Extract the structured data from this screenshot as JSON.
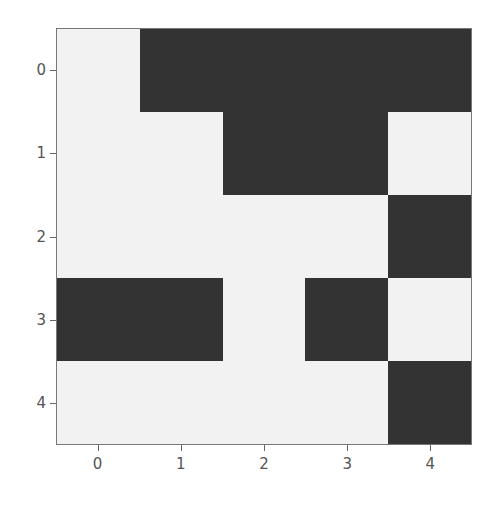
{
  "chart_data": {
    "type": "heatmap",
    "title": "",
    "xlabel": "",
    "ylabel": "",
    "x_ticks": [
      "0",
      "1",
      "2",
      "3",
      "4"
    ],
    "y_ticks": [
      "0",
      "1",
      "2",
      "3",
      "4"
    ],
    "colormap": {
      "0": "#f2f2f2",
      "1": "#333333"
    },
    "grid": false,
    "matrix": [
      [
        0,
        1,
        1,
        1,
        1
      ],
      [
        0,
        0,
        1,
        1,
        0
      ],
      [
        0,
        0,
        0,
        0,
        1
      ],
      [
        1,
        1,
        0,
        1,
        0
      ],
      [
        0,
        0,
        0,
        0,
        1
      ]
    ]
  },
  "axes": {
    "x_labels": [
      "0",
      "1",
      "2",
      "3",
      "4"
    ],
    "y_labels": [
      "0",
      "1",
      "2",
      "3",
      "4"
    ]
  }
}
